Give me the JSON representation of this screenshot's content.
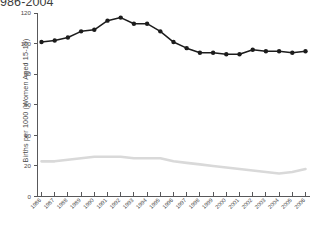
{
  "chart_data": {
    "type": "line",
    "title": "986-2004",
    "xlabel": "",
    "ylabel": "Births per 1000 (Women Aged 15-19)",
    "ylim": [
      0,
      120
    ],
    "yticks": [
      0,
      20,
      40,
      60,
      80,
      100,
      120
    ],
    "ytick_labels": [
      "0",
      "20",
      "40",
      "60",
      "80",
      "100",
      "120"
    ],
    "grid": false,
    "legend": "none",
    "categories": [
      "1986",
      "1987",
      "1988",
      "1989",
      "1990",
      "1991",
      "1992",
      "1993",
      "1994",
      "1995",
      "1996",
      "1997",
      "1998",
      "1999",
      "2000",
      "2001",
      "2002",
      "2003",
      "2004",
      "2005",
      "2006"
    ],
    "series": [
      {
        "name": "dark-series",
        "color": "#1c1c1c",
        "marker": "circle",
        "values": [
          101,
          102,
          104,
          108,
          109,
          115,
          117,
          113,
          113,
          108,
          101,
          97,
          94,
          94,
          93,
          93,
          96,
          95,
          95,
          94,
          95
        ]
      },
      {
        "name": "light-series",
        "color": "#d9d9d9",
        "marker": "none",
        "values": [
          23,
          23,
          24,
          25,
          26,
          26,
          26,
          25,
          25,
          25,
          23,
          22,
          21,
          20,
          19,
          18,
          17,
          16,
          15,
          16,
          18
        ]
      }
    ]
  }
}
